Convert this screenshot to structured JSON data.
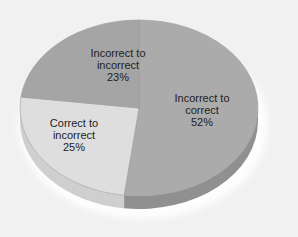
{
  "chart_data": {
    "type": "pie",
    "style": "3d",
    "title": "",
    "legend": "none",
    "slices": [
      {
        "label_line1": "Incorrect to",
        "label_line2": "correct",
        "value": 52,
        "value_label": "52%",
        "color": "#ababab",
        "side_color": "#909090"
      },
      {
        "label_line1": "Correct to",
        "label_line2": "incorrect",
        "value": 25,
        "value_label": "25%",
        "color": "#dedede",
        "side_color": "#cfcfcf"
      },
      {
        "label_line1": "Incorrect to",
        "label_line2": "incorrect",
        "value": 23,
        "value_label": "23%",
        "color": "#a5a5a5",
        "side_color": "#8f8f8f"
      }
    ]
  },
  "colors": {
    "background": "#f1f1f1",
    "shadow": "#ffffff",
    "label_text": "#222222"
  }
}
